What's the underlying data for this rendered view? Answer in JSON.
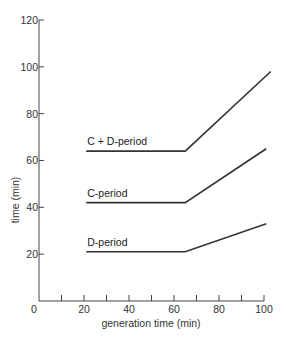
{
  "chart_data": {
    "type": "line",
    "title": "",
    "xlabel": "generation time (min)",
    "ylabel": "time (min)",
    "xlim": [
      0,
      100
    ],
    "ylim": [
      0,
      120
    ],
    "x_ticks_major": [
      0,
      20,
      40,
      60,
      80,
      100
    ],
    "x_ticks_minor": [
      10,
      30,
      50,
      70,
      90
    ],
    "y_ticks": [
      20,
      40,
      60,
      80,
      100,
      120
    ],
    "x_tick_labels": [
      "0",
      "20",
      "40",
      "60",
      "80",
      "100"
    ],
    "y_tick_labels": [
      "20",
      "40",
      "60",
      "80",
      "100",
      "120"
    ],
    "grid": false,
    "legend": "inline labels above lines",
    "series": [
      {
        "name": "C + D-period",
        "x": [
          21,
          65,
          103
        ],
        "y": [
          64,
          64,
          98
        ]
      },
      {
        "name": "C-period",
        "x": [
          21,
          65,
          101
        ],
        "y": [
          42,
          42,
          65
        ]
      },
      {
        "name": "D-period",
        "x": [
          21,
          65,
          101
        ],
        "y": [
          21,
          21,
          33
        ]
      }
    ]
  }
}
